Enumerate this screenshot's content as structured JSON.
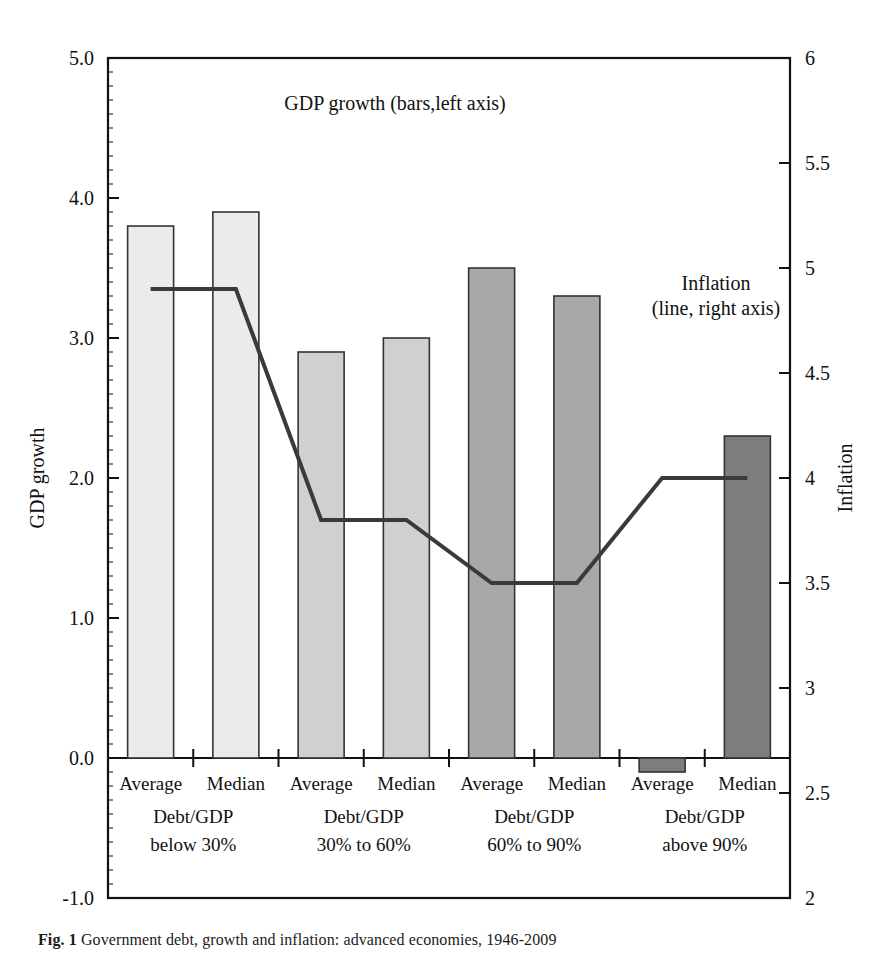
{
  "chart_data": {
    "type": "bar",
    "title": "",
    "annotations": [
      {
        "id": "bars-note",
        "text": "GDP growth (bars,left axis)"
      },
      {
        "id": "line-note-1",
        "text": "Inflation"
      },
      {
        "id": "line-note-2",
        "text": "(line, right axis)"
      }
    ],
    "xlabel": "",
    "ylabel": "GDP growth",
    "y2label": "Inflation",
    "ylim": [
      -1.0,
      5.0
    ],
    "y2lim": [
      2,
      6
    ],
    "yticks": [
      "5.0",
      "4.0",
      "3.0",
      "2.0",
      "1.0",
      "0.0",
      "-1.0"
    ],
    "ytick_values": [
      5.0,
      4.0,
      3.0,
      2.0,
      1.0,
      0.0,
      -1.0
    ],
    "y2ticks": [
      "6",
      "5.5",
      "5",
      "4.5",
      "4",
      "3.5",
      "3",
      "2.5",
      "2"
    ],
    "y2tick_values": [
      6,
      5.5,
      5,
      4.5,
      4,
      3.5,
      3,
      2.5,
      2
    ],
    "grid": false,
    "legend": "none",
    "categories": [
      "Average",
      "Median",
      "Average",
      "Median",
      "Average",
      "Median",
      "Average",
      "Median"
    ],
    "groups": [
      {
        "label_line1": "Debt/GDP",
        "label_line2": "below 30%",
        "fill": "#ebebeb"
      },
      {
        "label_line1": "Debt/GDP",
        "label_line2": "30% to 60%",
        "fill": "#d0d0d0"
      },
      {
        "label_line1": "Debt/GDP",
        "label_line2": "60% to 90%",
        "fill": "#a8a8a8"
      },
      {
        "label_line1": "Debt/GDP",
        "label_line2": "above 90%",
        "fill": "#7d7d7d"
      }
    ],
    "series": [
      {
        "name": "GDP growth",
        "kind": "bar",
        "axis": "left",
        "values": [
          3.8,
          3.9,
          2.9,
          3.0,
          3.5,
          3.3,
          -0.1,
          2.3
        ]
      },
      {
        "name": "Inflation",
        "kind": "line",
        "axis": "right",
        "values": [
          4.9,
          4.9,
          3.8,
          3.8,
          3.5,
          3.5,
          4.0,
          4.0
        ]
      }
    ]
  },
  "figure": {
    "caption_label": "Fig. 1",
    "caption_text": "Government debt, growth and inflation: advanced economies, 1946-2009"
  }
}
